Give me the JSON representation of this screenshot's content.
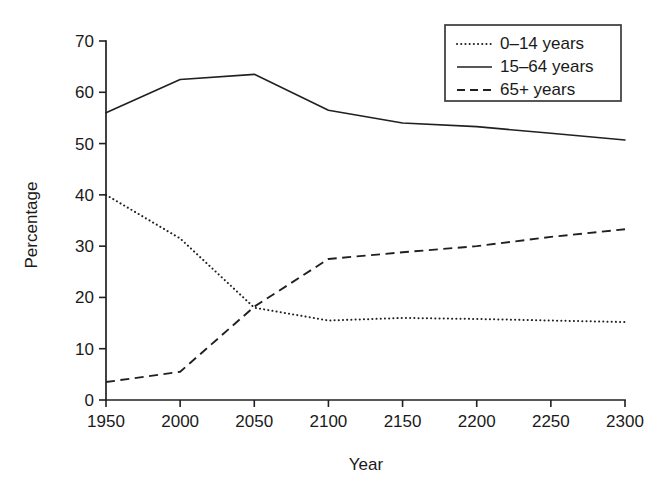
{
  "chart_data": {
    "type": "line",
    "title": "",
    "xlabel": "Year",
    "ylabel": "Percentage",
    "xlim": [
      1950,
      2300
    ],
    "ylim": [
      0,
      70
    ],
    "x": [
      1950,
      2000,
      2050,
      2100,
      2150,
      2200,
      2250,
      2300
    ],
    "xticks": [
      "1950",
      "2000",
      "2050",
      "2100",
      "2150",
      "2200",
      "2250",
      "2300"
    ],
    "yticks": [
      "0",
      "10",
      "20",
      "30",
      "40",
      "50",
      "60",
      "70"
    ],
    "grid": false,
    "legend_position": "top-right",
    "series": [
      {
        "name": "0–14 years",
        "style": "dotted",
        "values": [
          40.0,
          31.5,
          18.0,
          15.5,
          16.0,
          15.8,
          15.5,
          15.2
        ]
      },
      {
        "name": "15–64 years",
        "style": "solid",
        "values": [
          56.0,
          62.5,
          63.5,
          56.5,
          54.0,
          53.3,
          52.0,
          50.7
        ]
      },
      {
        "name": "65+ years",
        "style": "dashed",
        "values": [
          3.5,
          5.5,
          18.2,
          27.5,
          28.8,
          30.0,
          31.8,
          33.3
        ]
      }
    ]
  },
  "legend": {
    "entries": [
      {
        "label": "0–14 years",
        "style": "dotted"
      },
      {
        "label": "15–64 years",
        "style": "solid"
      },
      {
        "label": "65+ years",
        "style": "dashed"
      }
    ]
  },
  "colors": {
    "ink": "#231f20",
    "background": "#ffffff",
    "legend_border": "#3a3a3a"
  }
}
